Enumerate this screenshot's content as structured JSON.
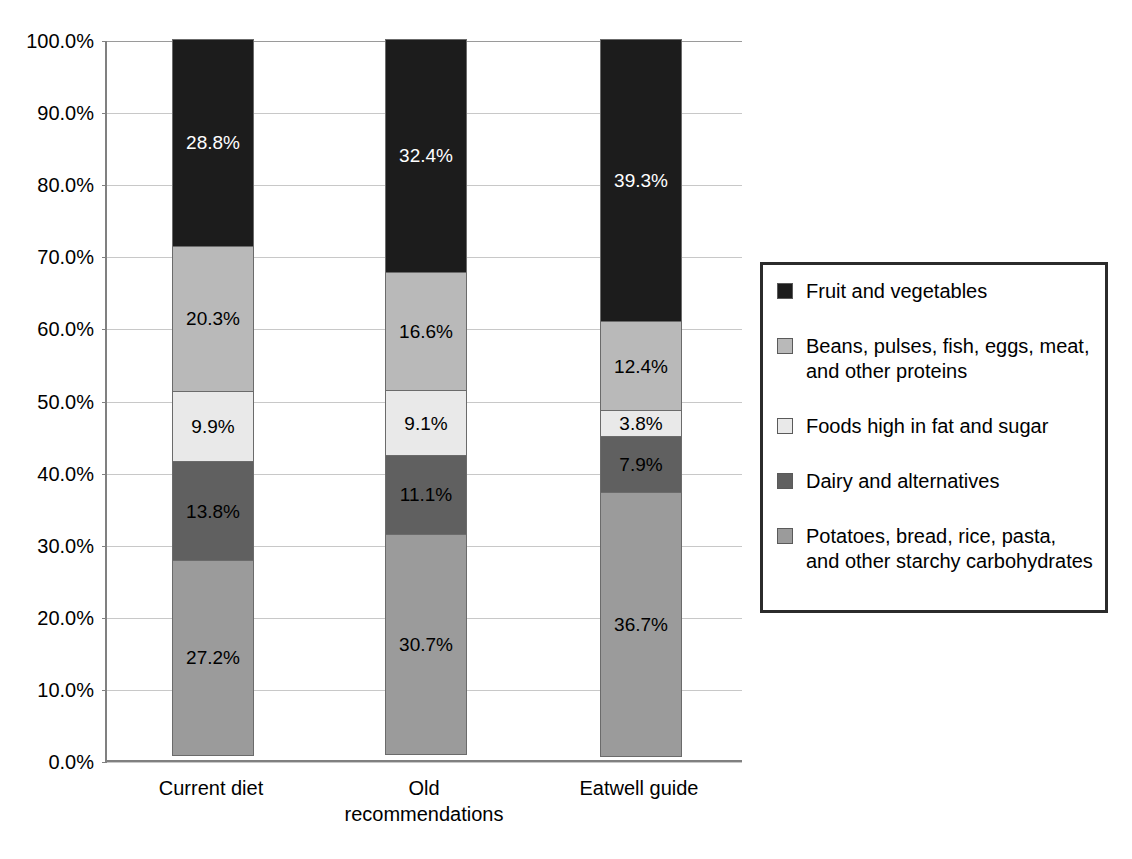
{
  "chart_data": {
    "type": "bar",
    "subtype": "stacked-100-percent",
    "title": "",
    "xlabel": "",
    "ylabel": "",
    "ylim": [
      0,
      100
    ],
    "ytick_labels": [
      "0.0%",
      "10.0%",
      "20.0%",
      "30.0%",
      "40.0%",
      "50.0%",
      "60.0%",
      "70.0%",
      "80.0%",
      "90.0%",
      "100.0%"
    ],
    "ytick_values": [
      0,
      10,
      20,
      30,
      40,
      50,
      60,
      70,
      80,
      90,
      100
    ],
    "grid": true,
    "legend_position": "right",
    "categories": [
      "Current diet",
      "Old recommendations",
      "Eatwell guide"
    ],
    "category_label_lines": [
      [
        "Current diet"
      ],
      [
        "Old",
        "recommendations"
      ],
      [
        "Eatwell guide"
      ]
    ],
    "series": [
      {
        "name": "Fruit and vegetables",
        "color": "#1c1c1c",
        "label_color": "#ffffff",
        "values": [
          28.8,
          32.4,
          39.3
        ],
        "labels": [
          "28.8%",
          "32.4%",
          "39.3%"
        ]
      },
      {
        "name": "Beans, pulses, fish, eggs, meat, and other proteins",
        "color": "#b9b9b9",
        "label_color": "#000000",
        "values": [
          20.3,
          16.6,
          12.4
        ],
        "labels": [
          "20.3%",
          "16.6%",
          "12.4%"
        ]
      },
      {
        "name": "Foods high in fat and sugar",
        "color": "#e9e9e9",
        "label_color": "#000000",
        "values": [
          9.9,
          9.1,
          3.8
        ],
        "labels": [
          "9.9%",
          "9.1%",
          "3.8%"
        ]
      },
      {
        "name": "Dairy and alternatives",
        "color": "#606060",
        "label_color": "#000000",
        "values": [
          13.8,
          11.1,
          7.9
        ],
        "labels": [
          "13.8%",
          "11.1%",
          "7.9%"
        ]
      },
      {
        "name": "Potatoes, bread, rice, pasta, and other starchy carbohydrates",
        "color": "#9b9b9b",
        "label_color": "#000000",
        "values": [
          27.2,
          30.7,
          36.7
        ],
        "labels": [
          "27.2%",
          "30.7%",
          "36.7%"
        ]
      }
    ]
  },
  "legend": {
    "items": [
      {
        "label": "Fruit and vegetables",
        "color": "#1c1c1c"
      },
      {
        "label": "Beans, pulses, fish, eggs, meat, and other proteins",
        "color": "#b9b9b9"
      },
      {
        "label": "Foods high in fat and sugar",
        "color": "#e9e9e9"
      },
      {
        "label": "Dairy and alternatives",
        "color": "#606060"
      },
      {
        "label": "Potatoes, bread, rice, pasta, and other starchy carbohydrates",
        "color": "#9b9b9b"
      }
    ]
  },
  "style": {
    "axis_color": "#808080",
    "grid_color": "#c8c8c8",
    "legend_border_color": "#2b2b2b",
    "segment_border_color": "#6b6b6b",
    "background": "#ffffff"
  }
}
